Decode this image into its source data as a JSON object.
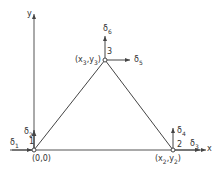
{
  "diagram": {
    "axes": {
      "x_label": "x",
      "y_label": "y"
    },
    "nodes": [
      {
        "id": "1",
        "coord_label": "(0,0)",
        "dofs": [
          "δ1",
          "δ2"
        ]
      },
      {
        "id": "2",
        "coord_label": "(x2,y2)",
        "dofs": [
          "δ3",
          "δ4"
        ]
      },
      {
        "id": "3",
        "coord_label": "(x3,y3)",
        "dofs": [
          "δ5",
          "δ6"
        ]
      }
    ],
    "labels": {
      "node1": "1",
      "node2": "2",
      "node3": "3",
      "coord1": "(0,0)",
      "coord2_x": "(x",
      "coord2_xs": "2",
      "coord2_mid": ",y",
      "coord2_ys": "2",
      "coord2_end": ")",
      "coord3_x": "(x",
      "coord3_xs": "3",
      "coord3_mid": ",y",
      "coord3_ys": "3",
      "coord3_end": ")",
      "d1": "δ",
      "d1s": "1",
      "d2": "δ",
      "d2s": "2",
      "d3": "δ",
      "d3s": "3",
      "d4": "δ",
      "d4s": "4",
      "d5": "δ",
      "d5s": "5",
      "d6": "δ",
      "d6s": "6"
    },
    "line_color": "#444444"
  }
}
